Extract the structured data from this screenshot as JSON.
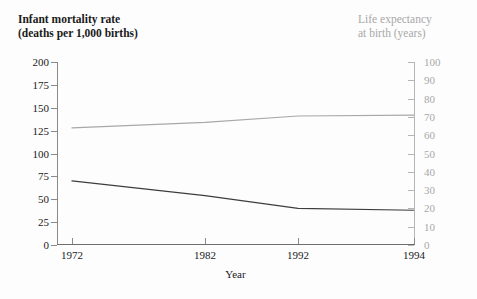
{
  "titles": {
    "left_axis": "Infant mortality rate\n(deaths per 1,000 births)",
    "right_axis": "Life expectancy\nat birth (years)",
    "xlabel": "Year"
  },
  "colors": {
    "infant_mortality_line": "#3d3d3d",
    "life_expectancy_line": "#a8a8a8",
    "left_axis_text": "#1a1a1a",
    "right_axis_text": "#a8a8a8",
    "background": "#fdfdfd"
  },
  "chart_data": {
    "type": "line",
    "title": "",
    "xlabel": "Year",
    "x": [
      "1972",
      "1982",
      "1992",
      "1994"
    ],
    "grid": false,
    "legend_position": "none",
    "axes": {
      "left": {
        "label": "Infant mortality rate (deaths per 1,000 births)",
        "ylim": [
          0,
          200
        ],
        "ticks": [
          0,
          25,
          50,
          75,
          100,
          125,
          150,
          175,
          200
        ],
        "tick_labels": [
          "0",
          "25",
          "50",
          "75",
          "100",
          "125",
          "150",
          "175",
          "200"
        ]
      },
      "right": {
        "label": "Life expectancy at birth (years)",
        "ylim": [
          0,
          100
        ],
        "ticks": [
          0,
          10,
          20,
          30,
          40,
          50,
          60,
          70,
          80,
          90,
          100
        ],
        "tick_labels": [
          "0",
          "10",
          "20",
          "30",
          "40",
          "50",
          "60",
          "70",
          "80",
          "90",
          "100"
        ]
      }
    },
    "series": [
      {
        "name": "Infant mortality rate",
        "axis": "left",
        "color": "#3d3d3d",
        "values": [
          70,
          54,
          40,
          38
        ]
      },
      {
        "name": "Life expectancy at birth",
        "axis": "right",
        "color": "#a8a8a8",
        "values": [
          64,
          67,
          70.5,
          71
        ]
      }
    ]
  }
}
